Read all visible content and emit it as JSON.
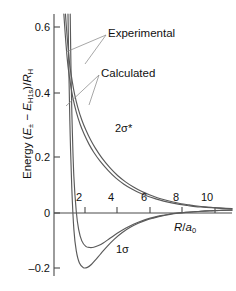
{
  "chart_data": {
    "type": "line",
    "title": "",
    "xlabel": "R/a0",
    "ylabel": "Energy (E± − EH1s)/RH",
    "xlim": [
      0,
      11.2
    ],
    "ylim": [
      -0.23,
      0.68
    ],
    "grid": false,
    "legend_position": "inline-annotations",
    "axis": {
      "x_ticks": [
        2,
        4,
        6,
        8,
        10
      ],
      "x_tick_labels": [
        "2",
        "4",
        "6",
        "8",
        "10"
      ],
      "y_ticks": [
        -0.2,
        0,
        0.2,
        0.4,
        0.6
      ],
      "y_tick_labels": [
        "-0.2",
        "0",
        "0.2",
        "0.4",
        "0.6"
      ],
      "zero_line_y": 0
    },
    "series": [
      {
        "name": "2 sigma star calculated",
        "label": "2σ*",
        "kind": "antibonding",
        "style": "solid",
        "color": "#5a5a5a",
        "x": [
          0.72,
          0.8,
          0.9,
          1.0,
          1.15,
          1.3,
          1.5,
          1.75,
          2.0,
          2.3,
          2.6,
          3.0,
          3.5,
          4.0,
          4.5,
          5.0,
          5.5,
          6.0,
          6.5,
          7.0,
          7.5,
          8.0,
          8.5,
          9.0,
          9.5,
          10.0,
          10.6,
          11.2
        ],
        "y": [
          0.68,
          0.62,
          0.555,
          0.5,
          0.445,
          0.4,
          0.355,
          0.312,
          0.278,
          0.243,
          0.214,
          0.181,
          0.147,
          0.119,
          0.097,
          0.079,
          0.064,
          0.052,
          0.042,
          0.034,
          0.027,
          0.021,
          0.017,
          0.013,
          0.01,
          0.008,
          0.006,
          0.004
        ]
      },
      {
        "name": "2 sigma star experimental",
        "label": "2σ*",
        "kind": "antibonding",
        "style": "solid",
        "color": "#5a5a5a",
        "x": [
          0.62,
          0.7,
          0.8,
          0.9,
          1.05,
          1.2,
          1.4,
          1.65,
          1.9,
          2.2,
          2.5,
          2.9,
          3.4,
          3.9,
          4.4,
          4.9,
          5.4,
          5.9,
          6.4,
          6.9,
          7.4,
          7.9,
          8.4,
          8.9,
          9.4,
          9.9,
          10.5,
          11.2
        ],
        "y": [
          0.68,
          0.615,
          0.545,
          0.49,
          0.432,
          0.386,
          0.34,
          0.296,
          0.262,
          0.228,
          0.2,
          0.169,
          0.137,
          0.11,
          0.089,
          0.072,
          0.058,
          0.047,
          0.038,
          0.03,
          0.024,
          0.019,
          0.015,
          0.011,
          0.009,
          0.007,
          0.005,
          0.003
        ]
      },
      {
        "name": "1 sigma calculated",
        "label": "1σ",
        "kind": "bonding",
        "style": "solid",
        "color": "#5a5a5a",
        "minimum": {
          "x": 2.5,
          "y": -0.13
        },
        "x": [
          1.02,
          1.08,
          1.15,
          1.25,
          1.4,
          1.55,
          1.75,
          2.0,
          2.25,
          2.5,
          2.8,
          3.1,
          3.5,
          4.0,
          4.5,
          5.0,
          5.5,
          6.0,
          6.5,
          7.0,
          7.5,
          8.0,
          8.5,
          9.0,
          9.5,
          10.0,
          10.6,
          11.2
        ],
        "y": [
          0.68,
          0.45,
          0.28,
          0.115,
          -0.005,
          -0.068,
          -0.108,
          -0.127,
          -0.131,
          -0.13,
          -0.124,
          -0.115,
          -0.1,
          -0.081,
          -0.064,
          -0.05,
          -0.039,
          -0.03,
          -0.023,
          -0.018,
          -0.013,
          -0.01,
          -0.008,
          -0.006,
          -0.004,
          -0.003,
          -0.002,
          -0.001
        ]
      },
      {
        "name": "1 sigma experimental",
        "label": "1σ",
        "kind": "bonding",
        "style": "solid",
        "color": "#5a5a5a",
        "minimum": {
          "x": 2.1,
          "y": -0.2
        },
        "x": [
          0.88,
          0.95,
          1.02,
          1.12,
          1.25,
          1.4,
          1.6,
          1.85,
          2.1,
          2.35,
          2.6,
          2.95,
          3.35,
          3.8,
          4.3,
          4.8,
          5.3,
          5.8,
          6.3,
          6.8,
          7.3,
          7.8,
          8.3,
          8.8,
          9.3,
          9.8,
          10.5,
          11.2
        ],
        "y": [
          0.68,
          0.44,
          0.255,
          0.075,
          -0.068,
          -0.142,
          -0.185,
          -0.201,
          -0.2,
          -0.19,
          -0.175,
          -0.152,
          -0.127,
          -0.102,
          -0.079,
          -0.061,
          -0.047,
          -0.036,
          -0.028,
          -0.021,
          -0.016,
          -0.012,
          -0.009,
          -0.007,
          -0.005,
          -0.004,
          -0.002,
          -0.001
        ]
      }
    ],
    "annotations": [
      {
        "name": "experimental-annotation",
        "text": "Experimental",
        "x_px": 108,
        "y_px": 27,
        "leaders": [
          {
            "from": [
              106,
              35
            ],
            "to": [
              66,
              52
            ]
          },
          {
            "from": [
              106,
              35
            ],
            "to": [
              85,
              64
            ]
          }
        ]
      },
      {
        "name": "calculated-annotation",
        "text": "Calculated",
        "x_px": 101,
        "y_px": 67,
        "leaders": [
          {
            "from": [
              99,
              75
            ],
            "to": [
              66,
              106
            ]
          },
          {
            "from": [
              99,
              75
            ],
            "to": [
              89,
              105
            ]
          }
        ]
      },
      {
        "name": "antibonding-curve-label",
        "text": "2σ*",
        "x_px": 115,
        "y_px": 122
      },
      {
        "name": "bonding-curve-label",
        "text": "1σ",
        "x_px": 116,
        "y_px": 243
      }
    ]
  },
  "axis_titles": {
    "y_prefix": "Energy (",
    "y_var": "E",
    "y_var_sub": "±",
    "y_minus": " − ",
    "y_var2": "E",
    "y_var2_sub": "H1s",
    "y_close": ")/",
    "y_denom": "R",
    "y_denom_sub": "H",
    "x_num": "R",
    "x_slash": "/",
    "x_den": "a",
    "x_den_sub": "0"
  },
  "ticks": {
    "y": [
      {
        "label": "0.6",
        "top": 21
      },
      {
        "label": "0.4",
        "top": 87
      },
      {
        "label": "0.2",
        "top": 151
      },
      {
        "label": "0",
        "top": 207
      },
      {
        "label": "–0.2",
        "top": 262
      }
    ],
    "x": [
      {
        "label": "2",
        "left": 79
      },
      {
        "label": "4",
        "left": 111
      },
      {
        "label": "6",
        "left": 144
      },
      {
        "label": "8",
        "left": 176
      },
      {
        "label": "10",
        "left": 207
      }
    ]
  },
  "colors": {
    "curve": "#5a5a5a",
    "axis": "#4a4a4a",
    "text": "#111111",
    "background": "#ffffff"
  }
}
